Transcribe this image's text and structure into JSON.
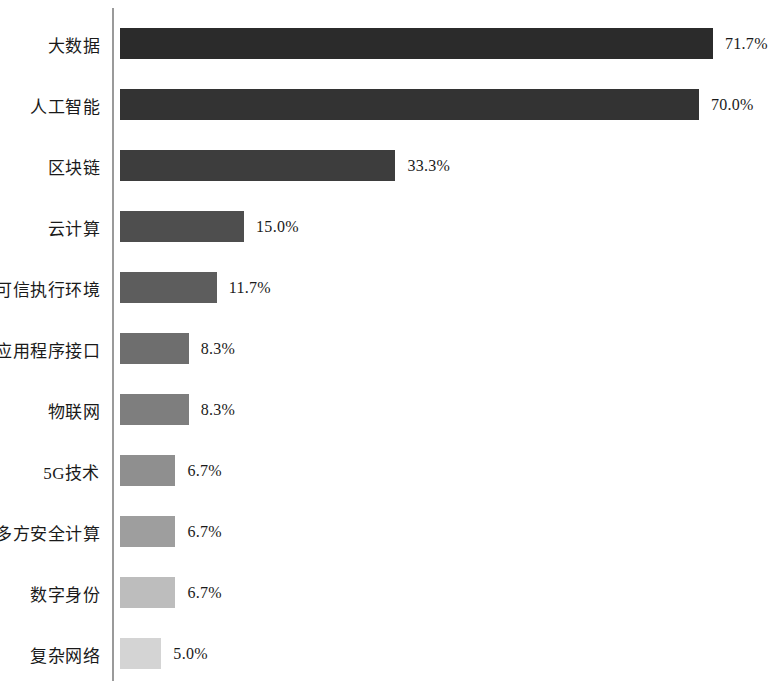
{
  "chart": {
    "background_color": "#ffffff",
    "axis_color": "#9a9a9a",
    "text_color": "#1a1a1a"
  },
  "chart_data": {
    "type": "bar",
    "orientation": "horizontal",
    "title": "",
    "subtitle": "",
    "xlabel": "",
    "ylabel": "",
    "xlim": [
      0,
      80
    ],
    "grid": false,
    "legend": false,
    "value_suffix": "%",
    "categories": [
      "大数据",
      "人工智能",
      "区块链",
      "云计算",
      "可信执行环境",
      "应用程序接口",
      "物联网",
      "5G技术",
      "多方安全计算",
      "数字身份",
      "复杂网络"
    ],
    "values": [
      71.7,
      70.0,
      33.3,
      15.0,
      11.7,
      8.3,
      8.3,
      6.7,
      6.7,
      6.7,
      5.0
    ],
    "value_labels": [
      "71.7%",
      "70.0%",
      "33.3%",
      "15.0%",
      "11.7%",
      "8.3%",
      "8.3%",
      "6.7%",
      "6.7%",
      "6.7%",
      "5.0%"
    ],
    "bar_colors": [
      "#2b2b2b",
      "#333333",
      "#3d3d3d",
      "#4e4e4e",
      "#5d5d5d",
      "#6e6e6e",
      "#7e7e7e",
      "#8f8f8f",
      "#9e9e9e",
      "#bdbdbd",
      "#d4d4d4"
    ]
  }
}
